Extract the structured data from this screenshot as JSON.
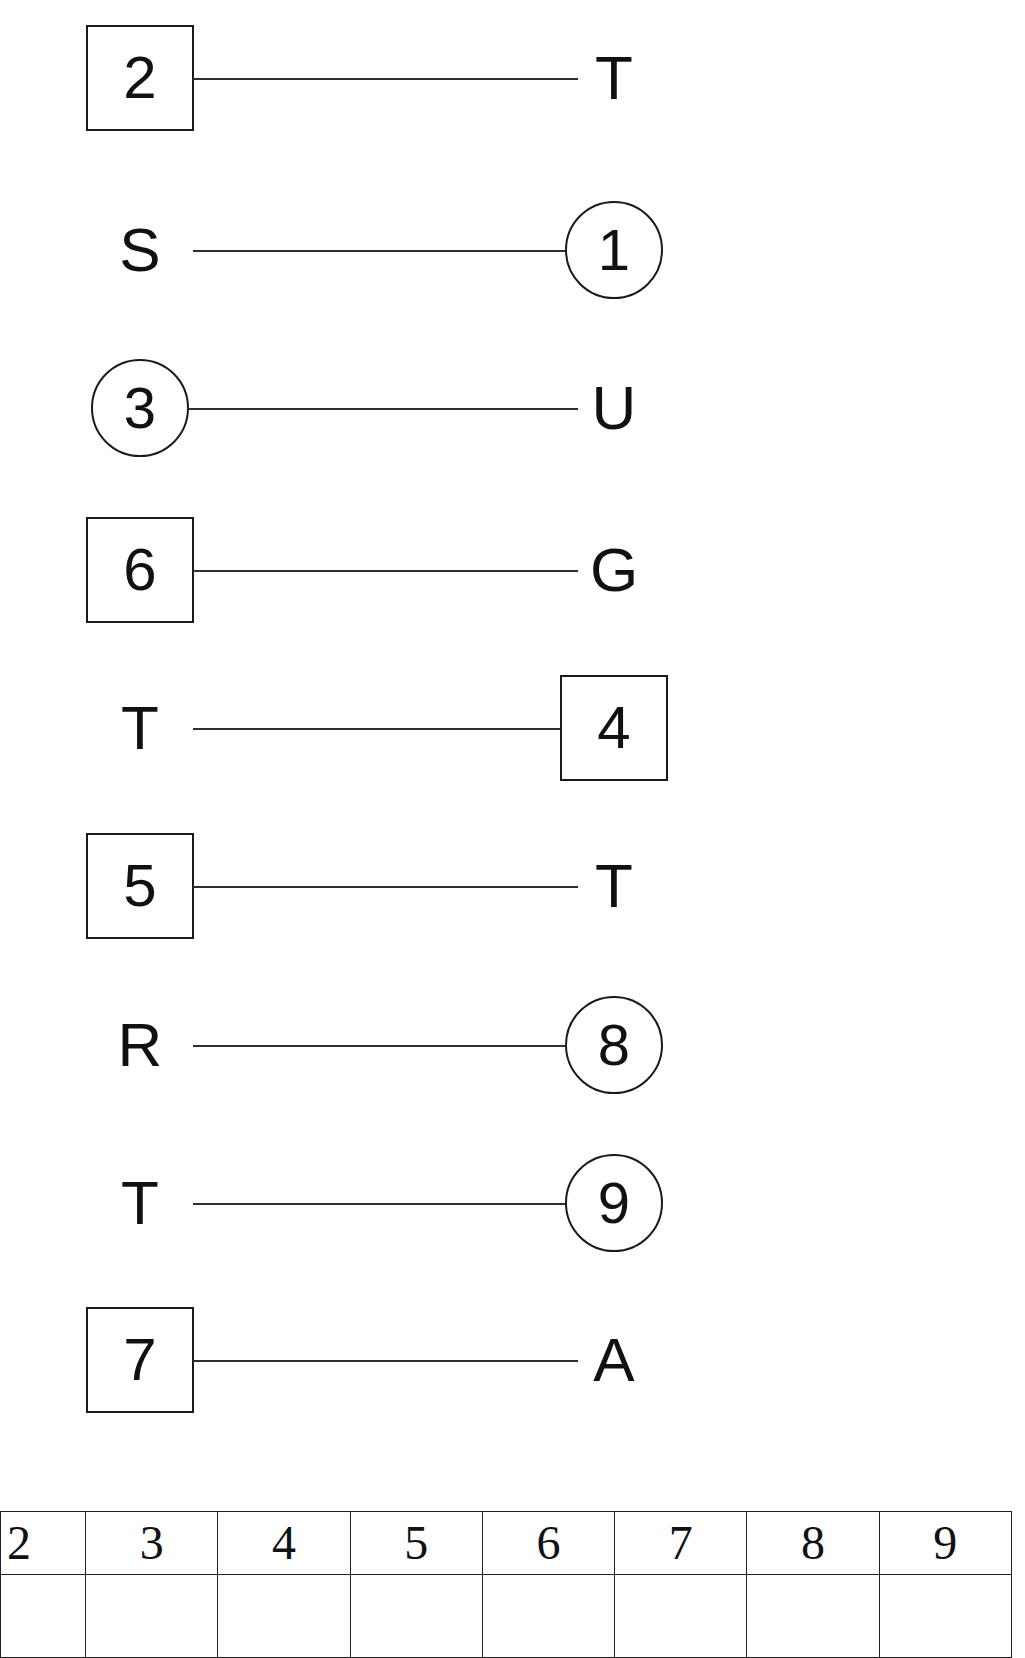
{
  "worksheet": {
    "type": "matching-exercise",
    "background_color": "#ffffff",
    "ink_color": "#1a1a1a"
  },
  "match_rows": [
    {
      "id": "row-1",
      "top": 18,
      "left": {
        "kind": "box",
        "text": "2"
      },
      "right": {
        "kind": "letter",
        "text": "T"
      },
      "line": {
        "x": 193,
        "width": 385
      }
    },
    {
      "id": "row-2",
      "top": 190,
      "left": {
        "kind": "letter",
        "text": "S"
      },
      "right": {
        "kind": "circle",
        "text": "1"
      },
      "line": {
        "x": 193,
        "width": 380
      }
    },
    {
      "id": "row-3",
      "top": 348,
      "left": {
        "kind": "circle",
        "text": "3"
      },
      "right": {
        "kind": "letter",
        "text": "U"
      },
      "line": {
        "x": 188,
        "width": 390
      }
    },
    {
      "id": "row-4",
      "top": 510,
      "left": {
        "kind": "box",
        "text": "6"
      },
      "right": {
        "kind": "letter",
        "text": "G"
      },
      "line": {
        "x": 193,
        "width": 385
      }
    },
    {
      "id": "row-5",
      "top": 668,
      "left": {
        "kind": "letter",
        "text": "T"
      },
      "right": {
        "kind": "box",
        "text": "4"
      },
      "line": {
        "x": 193,
        "width": 387
      }
    },
    {
      "id": "row-6",
      "top": 826,
      "left": {
        "kind": "box",
        "text": "5"
      },
      "right": {
        "kind": "letter",
        "text": "T"
      },
      "line": {
        "x": 193,
        "width": 385
      }
    },
    {
      "id": "row-7",
      "top": 985,
      "left": {
        "kind": "letter",
        "text": "R"
      },
      "right": {
        "kind": "circle",
        "text": "8"
      },
      "line": {
        "x": 193,
        "width": 380
      }
    },
    {
      "id": "row-8",
      "top": 1143,
      "left": {
        "kind": "letter",
        "text": "T"
      },
      "right": {
        "kind": "circle",
        "text": "9"
      },
      "line": {
        "x": 193,
        "width": 380
      }
    },
    {
      "id": "row-9",
      "top": 1300,
      "left": {
        "kind": "box",
        "text": "7"
      },
      "right": {
        "kind": "letter",
        "text": "A"
      },
      "line": {
        "x": 193,
        "width": 385
      }
    }
  ],
  "answer_table": {
    "headers": [
      "2",
      "3",
      "4",
      "5",
      "6",
      "7",
      "8",
      "9"
    ],
    "answers": [
      "",
      "",
      "",
      "",
      "",
      "",
      "",
      ""
    ]
  }
}
